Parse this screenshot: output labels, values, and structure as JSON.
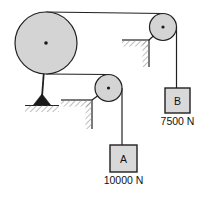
{
  "figure": {
    "background_color": "#ffffff",
    "line_color": "#231f20",
    "pulley_fill": "#d4d4d4",
    "block_fill": "#d9d9d9",
    "hatch_color": "#808080",
    "anchor_fill": "#1a1a1a"
  },
  "pulleys": [
    {
      "id": "large-pulley",
      "label": "",
      "cx": 46,
      "cy": 43,
      "r": 31
    },
    {
      "id": "middle-pulley",
      "label": "",
      "cx": 108.5,
      "cy": 88,
      "r": 13.5
    },
    {
      "id": "right-pulley",
      "label": "",
      "cx": 163,
      "cy": 27,
      "r": 13.5
    }
  ],
  "blocks": [
    {
      "id": "block-a",
      "letter": "A",
      "weight_label": "10000 N",
      "x": 110,
      "y": 145,
      "width": 27,
      "height": 27
    },
    {
      "id": "block-b",
      "letter": "B",
      "weight_label": "7500 N",
      "x": 165,
      "y": 88,
      "width": 25,
      "height": 25
    }
  ],
  "supports": [
    {
      "id": "ground-anchor",
      "type": "triangle-on-hatched-ground"
    },
    {
      "id": "middle-bracket",
      "type": "hatched-corner-bracket"
    },
    {
      "id": "right-bracket",
      "type": "hatched-corner-bracket"
    }
  ],
  "ropes": [
    {
      "id": "top-rope",
      "from": "large-pulley-top",
      "to": "right-pulley-top"
    },
    {
      "id": "lower-rope",
      "from": "large-pulley-bottom",
      "to": "middle-pulley-top"
    },
    {
      "id": "rope-to-block-a",
      "from": "middle-pulley-right",
      "to": "block-a"
    },
    {
      "id": "rope-to-block-b",
      "from": "right-pulley-right",
      "to": "block-b"
    },
    {
      "id": "anchor-rod",
      "from": "large-pulley-center",
      "to": "ground-anchor"
    }
  ]
}
